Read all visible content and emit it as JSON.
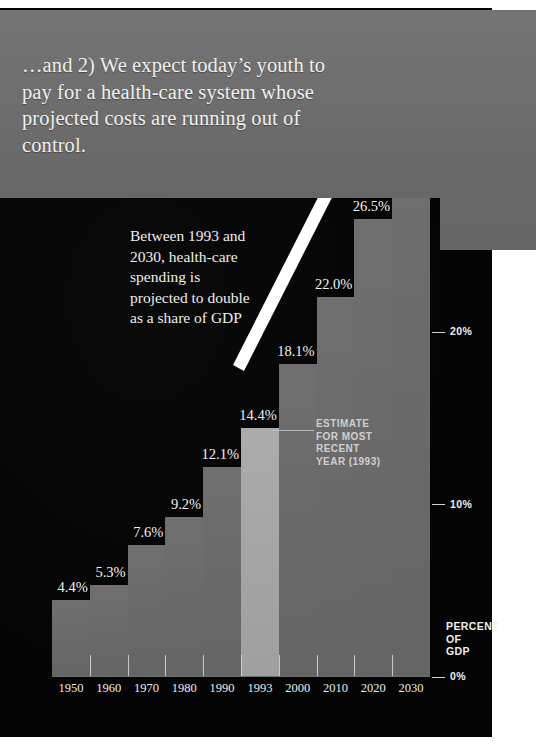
{
  "headline": "…and 2) We expect today’s youth to pay for a health-care system whose projected costs are running out of control.",
  "caption": "Between 1993 and 2030, health-care spending is projected to double as a share of GDP",
  "estimate_callout": {
    "line1": "ESTIMATE",
    "line2": "FOR MOST",
    "line3": "RECENT",
    "line4": "YEAR (1993)"
  },
  "axis": {
    "y_title_line1": "PERCENT",
    "y_title_line2": "OF",
    "y_title_line3": "GDP",
    "y_ticks": [
      "20%",
      "10%",
      "0%"
    ]
  },
  "colors": {
    "panel_gray": "#6d6d6d",
    "bar_gray": "#6a6a6a",
    "bar_highlight": "#a8a8a8",
    "background_black": "#040404",
    "text_light": "#f2f0ee"
  },
  "chart_data": {
    "type": "bar",
    "xlabel": "",
    "ylabel": "PERCENT OF GDP",
    "ylim": [
      0,
      34
    ],
    "grid": false,
    "legend": "none",
    "categories": [
      "1950",
      "1960",
      "1970",
      "1980",
      "1990",
      "1993",
      "2000",
      "2010",
      "2020",
      "2030"
    ],
    "values": [
      4.4,
      5.3,
      7.6,
      9.2,
      12.1,
      14.4,
      18.1,
      22.0,
      26.5,
      32.0
    ],
    "value_labels": [
      "4.4%",
      "5.3%",
      "7.6%",
      "9.2%",
      "12.1%",
      "14.4%",
      "18.1%",
      "22.0%",
      "26.5%",
      "32.0%"
    ],
    "highlight_index": 5,
    "highlight_note": "ESTIMATE FOR MOST RECENT YEAR (1993)",
    "ytick_values": [
      20,
      10,
      0
    ],
    "ytick_labels": [
      "20%",
      "10%",
      "0%"
    ]
  }
}
